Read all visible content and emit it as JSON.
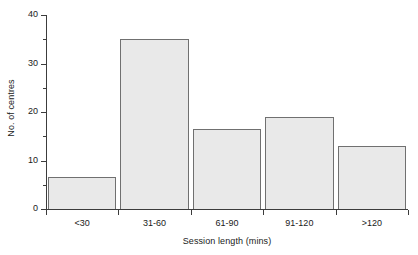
{
  "chart_data": {
    "type": "bar",
    "title": "",
    "subtitle": "",
    "xlabel": "Session length (mins)",
    "ylabel": "No. of centres",
    "categories": [
      "<30",
      "31-60",
      "61-90",
      "91-120",
      ">120"
    ],
    "values": [
      6.5,
      35,
      16.5,
      19,
      13
    ],
    "series": [
      {
        "name": "No. of centres",
        "values": [
          6.5,
          35,
          16.5,
          19,
          13
        ]
      }
    ],
    "ylim": [
      0,
      40
    ],
    "xlim": [
      0,
      5
    ],
    "y_major_ticks": [
      0,
      10,
      20,
      30,
      40
    ],
    "y_minor_ticks": [
      5,
      15,
      25,
      35
    ],
    "y_tick_labels": [
      "0",
      "10",
      "20",
      "30",
      "40"
    ],
    "grid": false,
    "legend": false,
    "legend_position": "none",
    "annotations": [],
    "bar_fill_color": "#e9e9e9",
    "bar_edge_color": "#707070",
    "axis_color": "#3c3c3c",
    "background_color": "#ffffff"
  },
  "axes": {
    "y_title": "No. of centres",
    "x_title": "Session length (mins)",
    "y_labels": [
      {
        "text": "0",
        "value": 0
      },
      {
        "text": "10",
        "value": 10
      },
      {
        "text": "20",
        "value": 20
      },
      {
        "text": "30",
        "value": 30
      },
      {
        "text": "40",
        "value": 40
      }
    ],
    "x_labels": [
      "<30",
      "31-60",
      "61-90",
      "91-120",
      ">120"
    ]
  }
}
